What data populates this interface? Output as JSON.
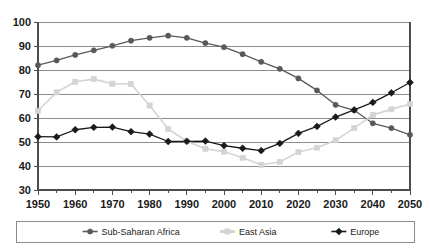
{
  "chart_data": {
    "type": "line",
    "title": "",
    "subtitle": "",
    "xlabel": "",
    "ylabel": "",
    "xlim": [
      1950,
      2050
    ],
    "ylim": [
      30,
      100
    ],
    "x": [
      1950,
      1955,
      1960,
      1965,
      1970,
      1975,
      1980,
      1985,
      1990,
      1995,
      2000,
      2005,
      2010,
      2015,
      2020,
      2025,
      2030,
      2035,
      2040,
      2045,
      2050
    ],
    "xticks": [
      1950,
      1960,
      1970,
      1980,
      1990,
      2000,
      2010,
      2020,
      2030,
      2040,
      2050
    ],
    "xtick_labels": [
      "1950",
      "1960",
      "1970",
      "1980",
      "1990",
      "2000",
      "2010",
      "2020",
      "2030",
      "2040",
      "2050"
    ],
    "xminor_ticks": [
      1955,
      1965,
      1975,
      1985,
      1995,
      2005,
      2015,
      2025,
      2035,
      2045
    ],
    "yticks": [
      30,
      40,
      50,
      60,
      70,
      80,
      90,
      100
    ],
    "ytick_labels": [
      "30",
      "40",
      "50",
      "60",
      "70",
      "80",
      "90",
      "100"
    ],
    "grid": true,
    "grid_axis": "y",
    "legend_position": "bottom",
    "series": [
      {
        "name": "Sub-Saharan Africa",
        "color": "#595959",
        "marker": "circle",
        "values": [
          82.0,
          84.0,
          86.3,
          88.2,
          90.1,
          92.2,
          93.4,
          94.3,
          93.4,
          91.2,
          89.5,
          86.6,
          83.4,
          80.5,
          76.5,
          71.5,
          65.5,
          63.2,
          57.8,
          55.8,
          53.0
        ]
      },
      {
        "name": "East Asia",
        "color": "#d4d4d4",
        "marker": "square",
        "values": [
          63.0,
          70.7,
          75.1,
          76.2,
          74.3,
          74.2,
          65.2,
          55.4,
          50.3,
          47.2,
          46.0,
          43.4,
          40.5,
          41.7,
          45.8,
          47.6,
          50.7,
          55.8,
          61.3,
          63.6,
          65.8
        ]
      },
      {
        "name": "Europe",
        "color": "#1a1a1a",
        "marker": "diamond",
        "values": [
          52.2,
          52.1,
          55.1,
          56.1,
          56.2,
          54.3,
          53.3,
          50.2,
          50.3,
          50.4,
          48.5,
          47.4,
          46.4,
          49.4,
          53.6,
          56.5,
          60.4,
          63.4,
          66.5,
          70.5,
          74.8
        ]
      }
    ],
    "annotations": []
  },
  "legend": {
    "entries": [
      {
        "label": "Sub-Saharan Africa",
        "marker": "circle",
        "color": "#595959"
      },
      {
        "label": "East Asia",
        "marker": "square",
        "color": "#d4d4d4"
      },
      {
        "label": "Europe",
        "marker": "diamond",
        "color": "#1a1a1a"
      }
    ]
  }
}
